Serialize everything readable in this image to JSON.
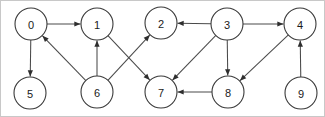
{
  "figure": {
    "type": "directed-graph",
    "background_color": "#ffffff",
    "border_color": "#c8c8c8",
    "node_fill": "#ffffff",
    "node_stroke": "#3a3a3a",
    "edge_color": "#4a4a4a",
    "arrow_color": "#2e2e2e",
    "label_color": "#1a1a1a",
    "node_radius": 16
  },
  "chart_data": {
    "type": "diagram",
    "title": "",
    "directed": true,
    "node_count": 10,
    "edge_count": 13,
    "nodes": [
      {
        "id": "0",
        "label": "0",
        "x": 30,
        "y": 23
      },
      {
        "id": "1",
        "label": "1",
        "x": 96,
        "y": 23
      },
      {
        "id": "2",
        "label": "2",
        "x": 160,
        "y": 22
      },
      {
        "id": "3",
        "label": "3",
        "x": 226,
        "y": 23
      },
      {
        "id": "4",
        "label": "4",
        "x": 299,
        "y": 23
      },
      {
        "id": "5",
        "label": "5",
        "x": 29,
        "y": 92
      },
      {
        "id": "6",
        "label": "6",
        "x": 96,
        "y": 91
      },
      {
        "id": "7",
        "label": "7",
        "x": 160,
        "y": 91
      },
      {
        "id": "8",
        "label": "8",
        "x": 227,
        "y": 91
      },
      {
        "id": "9",
        "label": "9",
        "x": 300,
        "y": 92
      }
    ],
    "edges": [
      {
        "from": "0",
        "to": "1"
      },
      {
        "from": "0",
        "to": "5"
      },
      {
        "from": "6",
        "to": "0"
      },
      {
        "from": "6",
        "to": "1"
      },
      {
        "from": "6",
        "to": "2"
      },
      {
        "from": "1",
        "to": "7"
      },
      {
        "from": "3",
        "to": "2"
      },
      {
        "from": "3",
        "to": "4"
      },
      {
        "from": "3",
        "to": "7"
      },
      {
        "from": "3",
        "to": "8"
      },
      {
        "from": "4",
        "to": "8"
      },
      {
        "from": "8",
        "to": "7"
      },
      {
        "from": "9",
        "to": "4"
      }
    ]
  }
}
